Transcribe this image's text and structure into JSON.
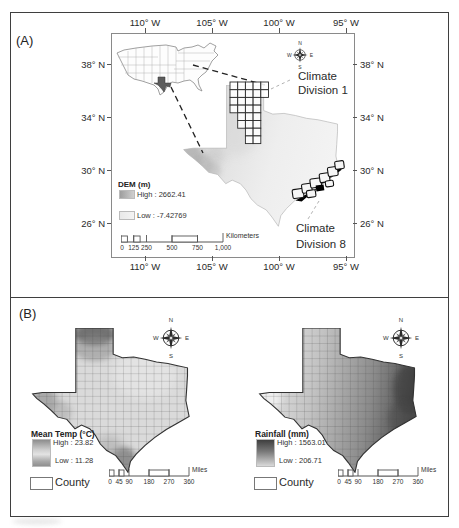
{
  "figure": {
    "panel_a_label": "(A)",
    "panel_b_label": "(B)"
  },
  "compass": {
    "n": "N",
    "e": "E",
    "s": "S",
    "w": "W"
  },
  "panel_a": {
    "lon_labels": [
      "110° W",
      "105° W",
      "100° W",
      "95° W"
    ],
    "lat_labels": [
      "38° N",
      "34° N",
      "30° N",
      "26° N"
    ],
    "cd1_line1": "Climate",
    "cd1_line2": "Division 1",
    "cd8_line1": "Climate",
    "cd8_line2": "Division 8",
    "dem_legend": {
      "title": "DEM (m)",
      "high": "High : 2662.41",
      "low": "Low : -7.42769"
    },
    "scalebar": {
      "labels": [
        "0",
        "125",
        "250",
        "500",
        "750",
        "1,000"
      ],
      "unit": "Kilometers"
    }
  },
  "panel_b": {
    "temp_map": {
      "legend_title": "Mean Temp (°C)",
      "high": "High : 23.82",
      "low": "Low : 11.28",
      "county_label": "County"
    },
    "rain_map": {
      "legend_title": "Rainfall (mm)",
      "high": "High : 1563.01",
      "low": "Low : 206.71",
      "county_label": "County"
    },
    "scalebar": {
      "labels": [
        "0",
        "45",
        "90",
        "180",
        "270",
        "360"
      ],
      "unit": "Miles"
    }
  },
  "colors": {
    "panel_border": "#3f3f3f",
    "texas_inset_fill": "#5c5c5c",
    "dem_high": "#a8a8a8",
    "dem_low": "#ececec",
    "rain_high": "#3f3f3f",
    "rain_low": "#e0e0e0"
  }
}
